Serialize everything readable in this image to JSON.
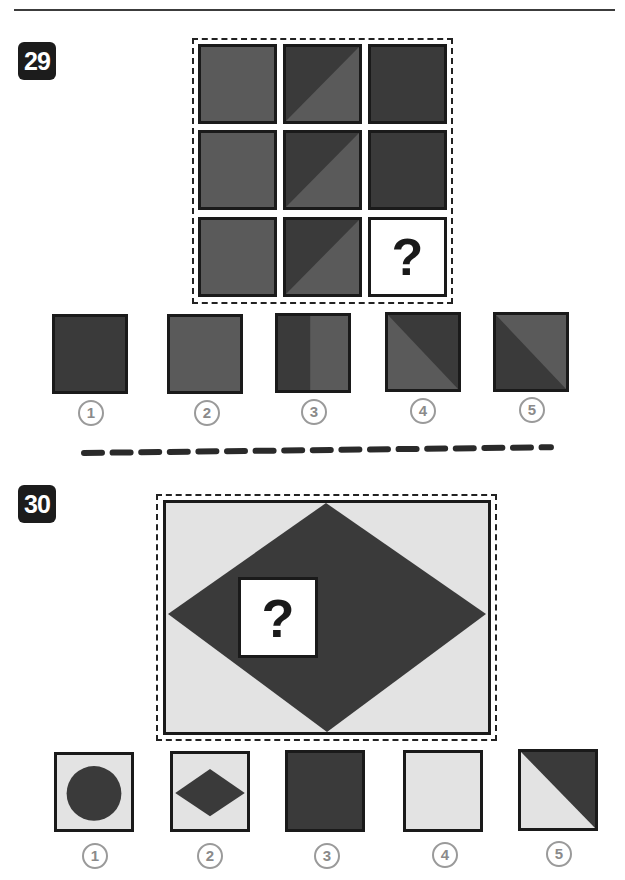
{
  "page": {
    "header_text": "",
    "colors": {
      "medium": "#5a5a5a",
      "dark": "#3a3a3a",
      "light": "#e3e3e3",
      "border": "#1a1a1a",
      "badge": "#1c1c1c",
      "label_circle": "#9a9a9a"
    }
  },
  "puzzle29": {
    "number": "29",
    "grid": [
      [
        {
          "type": "solid",
          "fill": "medium"
        },
        {
          "type": "diag",
          "top_left": "dark",
          "bottom_right": "medium"
        },
        {
          "type": "solid",
          "fill": "dark"
        }
      ],
      [
        {
          "type": "solid",
          "fill": "medium"
        },
        {
          "type": "diag",
          "top_left": "dark",
          "bottom_right": "medium"
        },
        {
          "type": "solid",
          "fill": "dark"
        }
      ],
      [
        {
          "type": "solid",
          "fill": "medium"
        },
        {
          "type": "diag",
          "top_left": "dark",
          "bottom_right": "medium"
        },
        {
          "type": "question",
          "label": "?"
        }
      ]
    ],
    "question_label": "?",
    "options": [
      {
        "label": "1",
        "description": "solid dark square"
      },
      {
        "label": "2",
        "description": "solid medium square"
      },
      {
        "label": "3",
        "description": "left half dark, right half medium"
      },
      {
        "label": "4",
        "description": "diagonal split: top-right dark, bottom-left medium"
      },
      {
        "label": "5",
        "description": "diagonal split: top-right medium, bottom-left dark"
      }
    ]
  },
  "puzzle30": {
    "number": "30",
    "question_label": "?",
    "figure": "light grey rectangle with large dark diamond; white missing-piece square with question mark",
    "options": [
      {
        "label": "1",
        "description": "light square with dark circle"
      },
      {
        "label": "2",
        "description": "light square with small dark diamond"
      },
      {
        "label": "3",
        "description": "solid dark square"
      },
      {
        "label": "4",
        "description": "solid light square"
      },
      {
        "label": "5",
        "description": "diagonal split: top-right dark, bottom-left light"
      }
    ]
  }
}
